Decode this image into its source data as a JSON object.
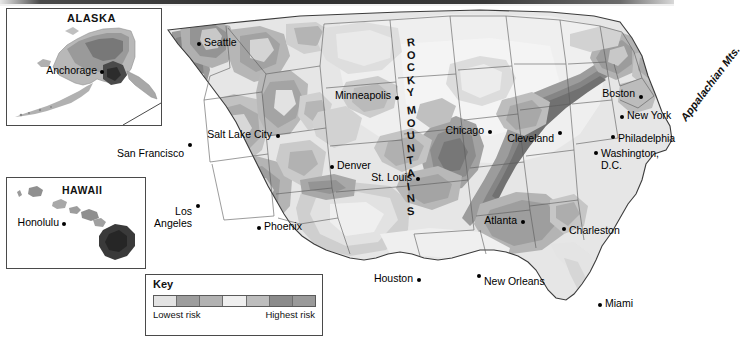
{
  "map": {
    "title": "Seismic hazard risk map of the United States",
    "insets": [
      {
        "name": "alaska",
        "title": "ALASKA",
        "cities": [
          {
            "name": "Anchorage"
          }
        ]
      },
      {
        "name": "hawaii",
        "title": "HAWAII",
        "cities": [
          {
            "name": "Honolulu"
          }
        ]
      }
    ],
    "range_labels": {
      "rocky": "ROCKY MOUNTAINS",
      "appalachian": "Appalachian Mts."
    },
    "cities": [
      {
        "name": "Seattle",
        "align": "left"
      },
      {
        "name": "Salt Lake City",
        "align": "right"
      },
      {
        "name": "San\nFrancisco",
        "align": "right"
      },
      {
        "name": "Los\nAngeles",
        "align": "right"
      },
      {
        "name": "Phoenix",
        "align": "left"
      },
      {
        "name": "Denver",
        "align": "left"
      },
      {
        "name": "Minneapolis",
        "align": "right"
      },
      {
        "name": "St. Louis",
        "align": "right"
      },
      {
        "name": "Chicago",
        "align": "right"
      },
      {
        "name": "Cleveland",
        "align": "right"
      },
      {
        "name": "Atlanta",
        "align": "right"
      },
      {
        "name": "Houston",
        "align": "right"
      },
      {
        "name": "New Orleans",
        "align": "left"
      },
      {
        "name": "Miami",
        "align": "left"
      },
      {
        "name": "Charleston",
        "align": "left"
      },
      {
        "name": "Boston",
        "align": "right"
      },
      {
        "name": "New York",
        "align": "left"
      },
      {
        "name": "Philadelphia",
        "align": "left"
      },
      {
        "name": "Washington,\nD.C.",
        "align": "left"
      }
    ]
  },
  "key": {
    "title": "Key",
    "low_label": "Lowest\nrisk",
    "high_label": "Highest\nrisk",
    "swatches": [
      "#e3e3e3",
      "#9d9d9d",
      "#b2b2b2",
      "#efefef",
      "#bdbdbd",
      "#8b8b8b",
      "#9a9a9a"
    ]
  },
  "palette": {
    "land_lightest": "#ededed",
    "land_light": "#dcdcdc",
    "land_mid": "#bfbfbf",
    "land_dark": "#a0a0a0",
    "land_darker": "#8a8a8a",
    "border": "#4a4a4a",
    "text": "#000000"
  }
}
